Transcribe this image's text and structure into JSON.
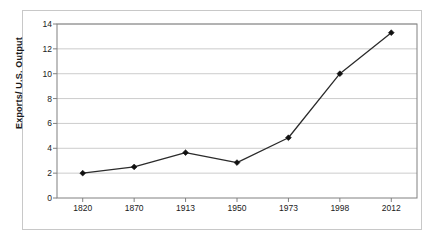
{
  "chart_data": {
    "type": "line",
    "title": "",
    "subtitle": "",
    "xlabel": "",
    "ylabel": "Exports/ U.S. Output",
    "categories": [
      "1820",
      "1870",
      "1913",
      "1950",
      "1973",
      "1998",
      "2012"
    ],
    "values": [
      2.0,
      2.5,
      3.65,
      2.85,
      4.85,
      10.0,
      13.3
    ],
    "series": [
      {
        "name": "Exports/ U.S. Output",
        "values": [
          2.0,
          2.5,
          3.65,
          2.85,
          4.85,
          10.0,
          13.3
        ]
      }
    ],
    "ylim": [
      0,
      14
    ],
    "yticks": [
      0,
      2,
      4,
      6,
      8,
      10,
      12,
      14
    ],
    "ytick_labels": [
      "0",
      "2",
      "4",
      "6",
      "8",
      "10",
      "12",
      "14"
    ],
    "xtick_labels": [
      "1820",
      "1870",
      "1913",
      "1950",
      "1973",
      "1998",
      "2012"
    ],
    "grid": "horizontal",
    "legend": "none",
    "marker": "diamond",
    "line_color": "#2b2b2b",
    "marker_color": "#111111",
    "grid_color": "#bfbfbf",
    "axis_color": "#808080",
    "frame_color": "#c8c8c8",
    "background": "#ffffff"
  }
}
